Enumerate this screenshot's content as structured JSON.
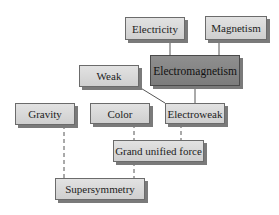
{
  "diagram": {
    "nodes": [
      {
        "id": "electricity",
        "label": "Electricity",
        "x": 125,
        "y": 17,
        "w": 60,
        "h": 23,
        "style": "light"
      },
      {
        "id": "magnetism",
        "label": "Magnetism",
        "x": 205,
        "y": 16,
        "w": 62,
        "h": 24,
        "style": "light"
      },
      {
        "id": "electromagnetism",
        "label": "Electromagnetism",
        "x": 150,
        "y": 55,
        "w": 90,
        "h": 31,
        "style": "dark"
      },
      {
        "id": "weak",
        "label": "Weak",
        "x": 79,
        "y": 65,
        "w": 60,
        "h": 22,
        "style": "light"
      },
      {
        "id": "gravity",
        "label": "Gravity",
        "x": 15,
        "y": 103,
        "w": 60,
        "h": 22,
        "style": "light"
      },
      {
        "id": "color",
        "label": "Color",
        "x": 90,
        "y": 103,
        "w": 60,
        "h": 21,
        "style": "light"
      },
      {
        "id": "electroweak",
        "label": "Electroweak",
        "x": 165,
        "y": 103,
        "w": 60,
        "h": 21,
        "style": "light"
      },
      {
        "id": "grand_unified",
        "label": "Grand unified force",
        "x": 113,
        "y": 140,
        "w": 91,
        "h": 22,
        "style": "light"
      },
      {
        "id": "supersymmetry",
        "label": "Supersymmetry",
        "x": 55,
        "y": 178,
        "w": 90,
        "h": 22,
        "style": "light"
      }
    ],
    "edges": [
      {
        "from": "electricity",
        "to": "electromagnetism",
        "style": "solid"
      },
      {
        "from": "magnetism",
        "to": "electromagnetism",
        "style": "solid"
      },
      {
        "from": "electromagnetism",
        "to": "electroweak",
        "style": "solid"
      },
      {
        "from": "weak",
        "to": "electroweak",
        "style": "solid"
      },
      {
        "from": "color",
        "to": "grand_unified",
        "style": "dashed"
      },
      {
        "from": "electroweak",
        "to": "grand_unified",
        "style": "dashed"
      },
      {
        "from": "grand_unified",
        "to": "supersymmetry",
        "style": "dashed"
      },
      {
        "from": "gravity",
        "to": "supersymmetry",
        "style": "dashed"
      }
    ]
  }
}
